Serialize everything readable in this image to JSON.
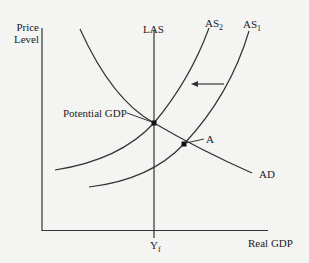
{
  "diagram": {
    "y_axis_label_line1": "Price",
    "y_axis_label_line2": "Level",
    "x_axis_label": "Real GDP",
    "curves": {
      "las": "LAS",
      "as2_main": "AS",
      "as2_sub": "2",
      "as1_main": "AS",
      "as1_sub": "1",
      "ad": "AD"
    },
    "points": {
      "potential_gdp": "Potential GDP",
      "a": "A"
    },
    "x_tick": {
      "main": "Y",
      "sub": "f"
    },
    "arrow_direction": "left",
    "colors": {
      "background": "#f4f4f2",
      "line": "#333333"
    }
  }
}
